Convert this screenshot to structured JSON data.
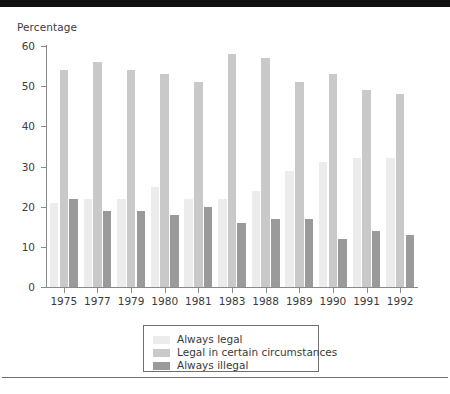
{
  "chart_data": {
    "type": "bar",
    "title": "",
    "subtitle": "",
    "xlabel": "",
    "ylabel": "Percentage",
    "ylim": [
      0,
      60
    ],
    "yticks": [
      0,
      10,
      20,
      30,
      40,
      50,
      60
    ],
    "grid": false,
    "legend_position": "bottom",
    "categories": [
      "1975",
      "1977",
      "1979",
      "1980",
      "1981",
      "1983",
      "1988",
      "1989",
      "1990",
      "1991",
      "1992"
    ],
    "series": [
      {
        "name": "Always legal",
        "color": "#ececed",
        "values": [
          21,
          22,
          22,
          25,
          22,
          22,
          24,
          29,
          31,
          32,
          32
        ]
      },
      {
        "name": "Legal in certain circumstances",
        "color": "#c9c9c9",
        "values": [
          54,
          56,
          54,
          53,
          51,
          58,
          57,
          51,
          53,
          49,
          48
        ]
      },
      {
        "name": "Always illegal",
        "color": "#9a9a9a",
        "values": [
          22,
          19,
          19,
          18,
          20,
          16,
          17,
          17,
          12,
          14,
          13
        ]
      }
    ]
  },
  "axis": {
    "y_title": "Percentage",
    "y_tick_labels": [
      "60",
      "50",
      "40",
      "30",
      "20",
      "10",
      "0"
    ],
    "x_tick_labels": [
      "1975",
      "1977",
      "1979",
      "1980",
      "1981",
      "1983",
      "1988",
      "1989",
      "1990",
      "1991",
      "1992"
    ]
  },
  "legend": {
    "items": [
      {
        "label": "Always legal",
        "color": "#ececed"
      },
      {
        "label": "Legal in certain circumstances",
        "color": "#c9c9c9"
      },
      {
        "label": "Always illegal",
        "color": "#9a9a9a"
      }
    ]
  },
  "colors": {
    "axis_line": "#8a8a8a",
    "text": "#3b3b3b",
    "top_rule": "#111111",
    "bottom_rule": "#6f6f6f",
    "legend_border": "#6f6f6f",
    "background": "#ffffff"
  }
}
